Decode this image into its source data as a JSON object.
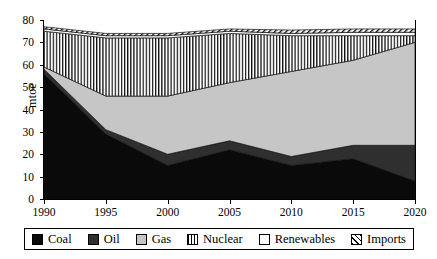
{
  "chart_data": {
    "type": "area",
    "title": "",
    "subtitle": "",
    "xlabel": "",
    "ylabel": "mtoe",
    "stacked": true,
    "grid": false,
    "legend_position": "bottom",
    "x": [
      1990,
      1995,
      2000,
      2005,
      2010,
      2015,
      2020
    ],
    "xticklabels": [
      "1990",
      "1995",
      "2000",
      "2005",
      "2010",
      "2015",
      "2020"
    ],
    "yticklabels": [
      "0",
      "10",
      "20",
      "30",
      "40",
      "50",
      "60",
      "70",
      "80"
    ],
    "yticks": [
      0,
      10,
      20,
      30,
      40,
      50,
      60,
      70,
      80
    ],
    "xlim": [
      1990,
      2020
    ],
    "ylim": [
      0,
      80
    ],
    "series": [
      {
        "name": "Coal",
        "color": "#0a0a0a",
        "fill": "solid",
        "values": [
          56,
          29,
          15,
          22,
          15,
          18,
          8
        ]
      },
      {
        "name": "Oil",
        "color": "#2f2f2f",
        "fill": "solid",
        "values": [
          2,
          2,
          5,
          4,
          4,
          6,
          16
        ]
      },
      {
        "name": "Gas",
        "color": "#c6c6c6",
        "fill": "solid",
        "values": [
          1,
          15,
          26,
          26,
          38,
          38,
          46
        ]
      },
      {
        "name": "Nuclear",
        "color": "#ffffff",
        "fill": "vertical-lines",
        "values": [
          16,
          26,
          26,
          22,
          16,
          11,
          3
        ]
      },
      {
        "name": "Renewables",
        "color": "#ffffff",
        "fill": "none",
        "values": [
          1,
          1,
          1,
          1,
          1,
          1.5,
          1.5
        ]
      },
      {
        "name": "Imports",
        "color": "#ffffff",
        "fill": "diagonal-hatch",
        "values": [
          1,
          1,
          1,
          1,
          1.5,
          1.5,
          1.5
        ]
      }
    ],
    "cumulative_tops": {
      "Coal": [
        56,
        29,
        15,
        22,
        15,
        18,
        8
      ],
      "Oil": [
        58,
        31,
        20,
        26,
        19,
        24,
        24
      ],
      "Gas": [
        59,
        46,
        46,
        52,
        57,
        62,
        70
      ],
      "Nuclear": [
        75,
        72,
        72,
        74,
        73,
        73,
        73
      ],
      "Renewables": [
        76,
        73,
        73,
        75,
        74,
        74.5,
        74.5
      ],
      "Imports": [
        77,
        74,
        74,
        76,
        75.5,
        76,
        76
      ]
    }
  },
  "axes": {
    "ylabel": "mtoe"
  },
  "legend": {
    "items": [
      {
        "label": "Coal"
      },
      {
        "label": "Oil"
      },
      {
        "label": "Gas"
      },
      {
        "label": "Nuclear"
      },
      {
        "label": "Renewables"
      },
      {
        "label": "Imports"
      }
    ]
  }
}
